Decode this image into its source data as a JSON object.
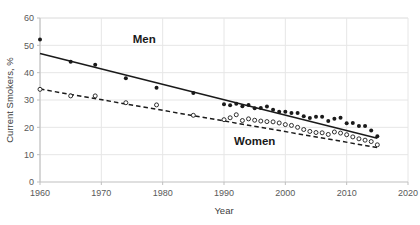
{
  "chart_data": {
    "type": "scatter",
    "title": "",
    "xlabel": "Year",
    "ylabel": "Current Smokers, %",
    "xlim": [
      1960,
      2020
    ],
    "ylim": [
      0,
      60
    ],
    "xticks": [
      1960,
      1970,
      1980,
      1990,
      2000,
      2010,
      2020
    ],
    "yticks": [
      0,
      10,
      20,
      30,
      40,
      50,
      60
    ],
    "grid": true,
    "legend": "inline-annotations",
    "annotations": [
      {
        "text": "Men",
        "x": 1977,
        "y": 51
      },
      {
        "text": "Women",
        "x": 1995,
        "y": 13.5
      }
    ],
    "series": [
      {
        "name": "Men",
        "marker": "filled-circle",
        "color": "#1a1a1a",
        "trendline": {
          "style": "solid",
          "x": [
            1960,
            2015
          ],
          "y": [
            47.0,
            16.0
          ]
        },
        "points": [
          {
            "x": 1960,
            "y": 52.1
          },
          {
            "x": 1965,
            "y": 44.0
          },
          {
            "x": 1969,
            "y": 42.9
          },
          {
            "x": 1974,
            "y": 38.0
          },
          {
            "x": 1979,
            "y": 34.5
          },
          {
            "x": 1985,
            "y": 32.6
          },
          {
            "x": 1990,
            "y": 28.4
          },
          {
            "x": 1991,
            "y": 28.1
          },
          {
            "x": 1992,
            "y": 28.6
          },
          {
            "x": 1993,
            "y": 27.7
          },
          {
            "x": 1994,
            "y": 28.2
          },
          {
            "x": 1995,
            "y": 27.0
          },
          {
            "x": 1996,
            "y": 27.1
          },
          {
            "x": 1997,
            "y": 27.6
          },
          {
            "x": 1998,
            "y": 26.4
          },
          {
            "x": 1999,
            "y": 25.7
          },
          {
            "x": 2000,
            "y": 25.7
          },
          {
            "x": 2001,
            "y": 25.2
          },
          {
            "x": 2002,
            "y": 25.2
          },
          {
            "x": 2003,
            "y": 24.1
          },
          {
            "x": 2004,
            "y": 23.4
          },
          {
            "x": 2005,
            "y": 23.9
          },
          {
            "x": 2006,
            "y": 23.9
          },
          {
            "x": 2007,
            "y": 22.3
          },
          {
            "x": 2008,
            "y": 23.1
          },
          {
            "x": 2009,
            "y": 23.5
          },
          {
            "x": 2010,
            "y": 21.5
          },
          {
            "x": 2011,
            "y": 21.6
          },
          {
            "x": 2012,
            "y": 20.5
          },
          {
            "x": 2013,
            "y": 20.5
          },
          {
            "x": 2014,
            "y": 18.8
          },
          {
            "x": 2015,
            "y": 16.7
          }
        ]
      },
      {
        "name": "Women",
        "marker": "open-circle",
        "color": "#1a1a1a",
        "trendline": {
          "style": "dashed",
          "x": [
            1960,
            2015
          ],
          "y": [
            34.0,
            12.6
          ]
        },
        "points": [
          {
            "x": 1960,
            "y": 33.9
          },
          {
            "x": 1965,
            "y": 31.5
          },
          {
            "x": 1969,
            "y": 31.5
          },
          {
            "x": 1974,
            "y": 29.0
          },
          {
            "x": 1979,
            "y": 28.2
          },
          {
            "x": 1985,
            "y": 24.4
          },
          {
            "x": 1990,
            "y": 22.8
          },
          {
            "x": 1991,
            "y": 23.5
          },
          {
            "x": 1992,
            "y": 24.6
          },
          {
            "x": 1993,
            "y": 22.5
          },
          {
            "x": 1994,
            "y": 23.1
          },
          {
            "x": 1995,
            "y": 22.6
          },
          {
            "x": 1996,
            "y": 22.3
          },
          {
            "x": 1997,
            "y": 22.1
          },
          {
            "x": 1998,
            "y": 22.0
          },
          {
            "x": 1999,
            "y": 21.6
          },
          {
            "x": 2000,
            "y": 21.0
          },
          {
            "x": 2001,
            "y": 20.7
          },
          {
            "x": 2002,
            "y": 20.0
          },
          {
            "x": 2003,
            "y": 19.2
          },
          {
            "x": 2004,
            "y": 18.5
          },
          {
            "x": 2005,
            "y": 18.1
          },
          {
            "x": 2006,
            "y": 18.0
          },
          {
            "x": 2007,
            "y": 17.4
          },
          {
            "x": 2008,
            "y": 18.3
          },
          {
            "x": 2009,
            "y": 17.9
          },
          {
            "x": 2010,
            "y": 17.3
          },
          {
            "x": 2011,
            "y": 16.5
          },
          {
            "x": 2012,
            "y": 15.8
          },
          {
            "x": 2013,
            "y": 15.3
          },
          {
            "x": 2014,
            "y": 14.8
          },
          {
            "x": 2015,
            "y": 13.6
          }
        ]
      }
    ]
  },
  "style": {
    "grid_color": "#e6e6e6",
    "axis_color": "#bfbfbf",
    "text_color": "#404040",
    "tick_color": "#595959",
    "marker_color": "#1a1a1a",
    "background": "#ffffff"
  }
}
